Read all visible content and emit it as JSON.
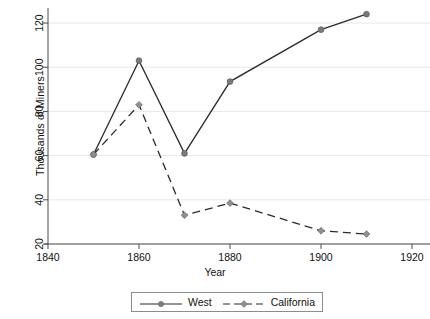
{
  "chart_data": {
    "type": "line",
    "title": "",
    "xlabel": "Year",
    "ylabel": "Thousands of Miners",
    "x": [
      1850,
      1860,
      1870,
      1880,
      1900,
      1910
    ],
    "xlim": [
      1840,
      1920
    ],
    "ylim": [
      20,
      125
    ],
    "xticks": [
      1840,
      1860,
      1880,
      1900,
      1920
    ],
    "xtick_labels": [
      "1840",
      "1860",
      "1880",
      "1900",
      "1920"
    ],
    "yticks": [
      20,
      40,
      60,
      80,
      100,
      120
    ],
    "ytick_labels": [
      "20",
      "40",
      "60",
      "80",
      "100",
      "120"
    ],
    "grid": "horizontal",
    "legend_position": "bottom-center",
    "series": [
      {
        "name": "West",
        "linestyle": "solid",
        "marker": "circle",
        "color": "#2b2b2b",
        "marker_color": "#7a7a7a",
        "x": [
          1850,
          1860,
          1870,
          1880,
          1900,
          1910
        ],
        "values": [
          60.5,
          103,
          61,
          93.5,
          117,
          124
        ]
      },
      {
        "name": "California",
        "linestyle": "dashed",
        "marker": "diamond",
        "color": "#2b2b2b",
        "marker_color": "#8f8f8f",
        "x": [
          1850,
          1860,
          1870,
          1880,
          1900,
          1910
        ],
        "values": [
          60.5,
          83,
          33,
          38.5,
          26,
          24.5
        ]
      }
    ]
  },
  "axis": {
    "ylabel": "Thousands of Miners",
    "xlabel": "Year"
  },
  "legend": {
    "items": [
      {
        "label": "West"
      },
      {
        "label": "California"
      }
    ]
  },
  "colors": {
    "line": "#2b2b2b",
    "marker": "#7f7f7f",
    "grid": "#e8e8e8",
    "axis": "#4d4d4d",
    "legend_border": "#8c8c8c"
  }
}
